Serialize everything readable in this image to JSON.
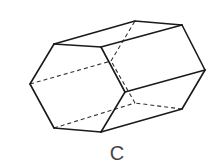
{
  "figure": {
    "label": "C",
    "shape": "hexagonal-prism",
    "colors": {
      "edge": "#1a1a1a",
      "hidden_edge": "#333333",
      "label": "#444444",
      "background": "#ffffff"
    },
    "front_face": [
      [
        54,
        44
      ],
      [
        101,
        47
      ],
      [
        125,
        92
      ],
      [
        101,
        132
      ],
      [
        54,
        128
      ],
      [
        30,
        84
      ]
    ],
    "back_face": [
      [
        135,
        21
      ],
      [
        182,
        25
      ],
      [
        205,
        70
      ],
      [
        182,
        109
      ],
      [
        135,
        103
      ],
      [
        111,
        61
      ]
    ],
    "visible_edges": [
      [
        [
          54,
          44
        ],
        [
          101,
          47
        ]
      ],
      [
        [
          101,
          47
        ],
        [
          125,
          92
        ]
      ],
      [
        [
          125,
          92
        ],
        [
          101,
          132
        ]
      ],
      [
        [
          101,
          132
        ],
        [
          54,
          128
        ]
      ],
      [
        [
          54,
          128
        ],
        [
          30,
          84
        ]
      ],
      [
        [
          30,
          84
        ],
        [
          54,
          44
        ]
      ],
      [
        [
          135,
          21
        ],
        [
          182,
          25
        ]
      ],
      [
        [
          182,
          25
        ],
        [
          205,
          70
        ]
      ],
      [
        [
          205,
          70
        ],
        [
          182,
          109
        ]
      ],
      [
        [
          54,
          44
        ],
        [
          135,
          21
        ]
      ],
      [
        [
          101,
          47
        ],
        [
          182,
          25
        ]
      ],
      [
        [
          125,
          92
        ],
        [
          205,
          70
        ]
      ],
      [
        [
          101,
          132
        ],
        [
          182,
          109
        ]
      ]
    ],
    "hidden_edges": [
      [
        [
          182,
          109
        ],
        [
          135,
          103
        ]
      ],
      [
        [
          135,
          103
        ],
        [
          111,
          61
        ]
      ],
      [
        [
          111,
          61
        ],
        [
          135,
          21
        ]
      ],
      [
        [
          30,
          84
        ],
        [
          111,
          61
        ]
      ],
      [
        [
          54,
          128
        ],
        [
          135,
          103
        ]
      ]
    ]
  }
}
